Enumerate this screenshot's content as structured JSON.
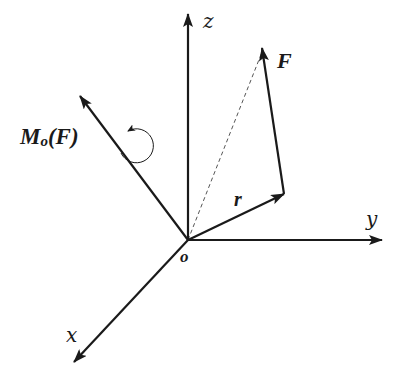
{
  "diagram": {
    "colors": {
      "stroke": "#1a1a1a",
      "dashed": "#555555",
      "background": "#ffffff"
    },
    "origin": {
      "x": 188,
      "y": 240,
      "label": "o"
    },
    "axes": [
      {
        "name": "z",
        "label": "z",
        "from": [
          188,
          240
        ],
        "to": [
          188,
          14
        ],
        "label_pos": [
          205,
          28
        ]
      },
      {
        "name": "y",
        "label": "y",
        "from": [
          188,
          240
        ],
        "to": [
          382,
          240
        ],
        "label_pos": [
          368,
          226
        ]
      },
      {
        "name": "x",
        "label": "x",
        "from": [
          188,
          240
        ],
        "to": [
          74,
          362
        ],
        "label_pos": [
          68,
          340
        ]
      }
    ],
    "vectors": [
      {
        "name": "moment",
        "label": "M",
        "label_sub": "o",
        "label_suffix": "(F)",
        "from": [
          188,
          240
        ],
        "to": [
          80,
          96
        ]
      },
      {
        "name": "r",
        "label": "r",
        "from": [
          188,
          240
        ],
        "to": [
          284,
          194
        ]
      },
      {
        "name": "F",
        "label": "F",
        "from": [
          284,
          194
        ],
        "to": [
          262,
          50
        ]
      }
    ],
    "dashed_line": {
      "from": [
        188,
        240
      ],
      "to": [
        262,
        50
      ]
    },
    "rotation_arrow": {
      "center": [
        134,
        150
      ],
      "radius": 16
    }
  }
}
